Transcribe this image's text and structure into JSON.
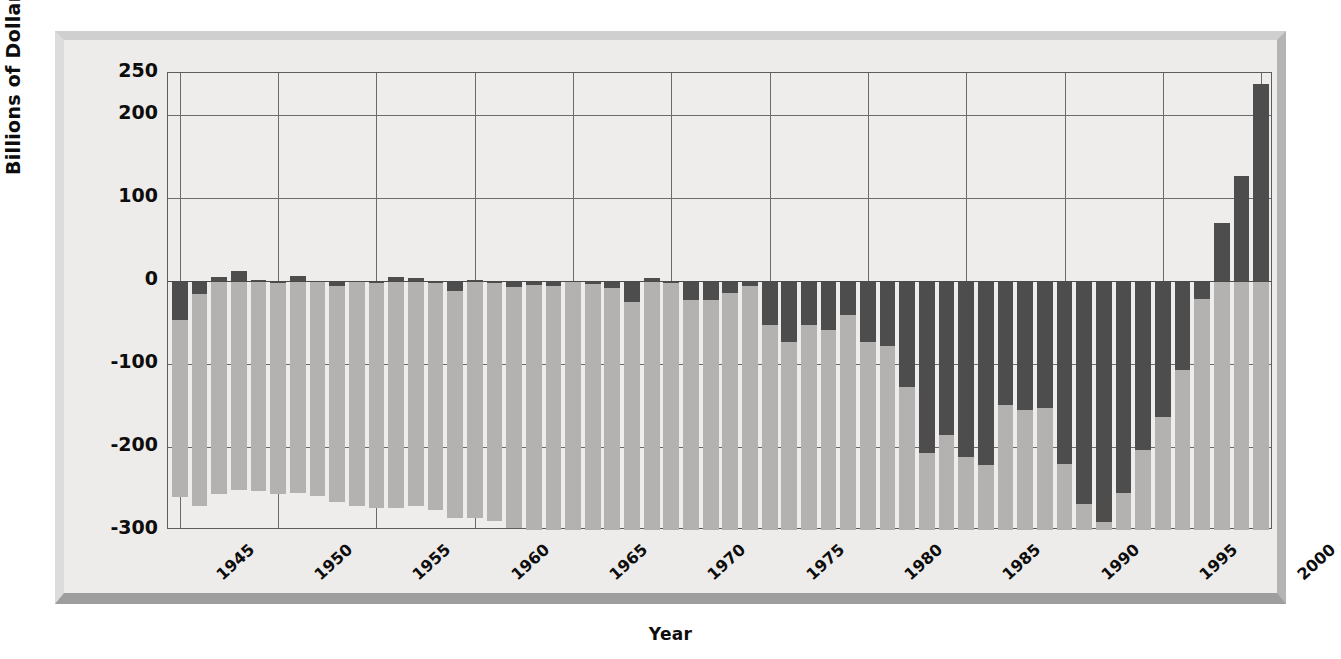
{
  "chart_data": {
    "type": "bar",
    "title": "",
    "xlabel": "Year",
    "ylabel": "Billions of Dollars",
    "ylim": [
      -300,
      250
    ],
    "xlim": [
      1944.4,
      2000.6
    ],
    "grid": true,
    "legend": "none",
    "y_ticks": [
      "250",
      "200",
      "100",
      "0",
      "-100",
      "-200",
      "-300"
    ],
    "y_tick_values": [
      250,
      200,
      100,
      0,
      -100,
      -200,
      -300
    ],
    "x_ticks": [
      "1945",
      "1950",
      "1955",
      "1960",
      "1965",
      "1970",
      "1975",
      "1980",
      "1985",
      "1990",
      "1995",
      "2000"
    ],
    "x_tick_values": [
      1945,
      1950,
      1955,
      1960,
      1965,
      1970,
      1975,
      1980,
      1985,
      1990,
      1995,
      2000
    ],
    "categories": [
      1945,
      1946,
      1947,
      1948,
      1949,
      1950,
      1951,
      1952,
      1953,
      1954,
      1955,
      1956,
      1957,
      1958,
      1959,
      1960,
      1961,
      1962,
      1963,
      1964,
      1965,
      1966,
      1967,
      1968,
      1969,
      1970,
      1971,
      1972,
      1973,
      1974,
      1975,
      1976,
      1977,
      1978,
      1979,
      1980,
      1981,
      1982,
      1983,
      1984,
      1985,
      1986,
      1987,
      1988,
      1989,
      1990,
      1991,
      1992,
      1993,
      1994,
      1995,
      1996,
      1997,
      1998,
      1999,
      2000
    ],
    "series": [
      {
        "name": "gross-national-debt",
        "color": "#b3b2b0",
        "note": "light bars, extend below the -300 axis floor (clipped)",
        "values": [
          -260,
          -271,
          -257,
          -252,
          -253,
          -257,
          -255,
          -259,
          -266,
          -271,
          -274,
          -273,
          -271,
          -276,
          -285,
          -286,
          -289,
          -298,
          -306,
          -312,
          -317,
          -320,
          -326,
          -348,
          -354,
          -371,
          -398,
          -427,
          -458,
          -475,
          -533,
          -620,
          -699,
          -772,
          -827,
          -908,
          -998,
          -1142,
          -1377,
          -1572,
          -1823,
          -2125,
          -2350,
          -2602,
          -2857,
          -3233,
          -3665,
          -4065,
          -4411,
          -4693,
          -4974,
          -5225,
          -5413,
          -5526,
          -5656,
          -5674
        ]
      },
      {
        "name": "annual-deficit-surplus",
        "color": "#4d4d4d",
        "note": "dark bars, federal budget surplus (+) or deficit (-)",
        "values": [
          -47.6,
          -15.9,
          4.0,
          11.8,
          0.6,
          -3.1,
          6.1,
          -1.5,
          -6.5,
          -1.2,
          -3.0,
          3.9,
          3.4,
          -2.8,
          -12.8,
          0.3,
          -3.3,
          -7.1,
          -4.8,
          -5.9,
          -1.4,
          -3.7,
          -8.6,
          -25.2,
          3.2,
          -2.8,
          -23.0,
          -23.4,
          -14.9,
          -6.1,
          -53.2,
          -73.7,
          -53.7,
          -59.2,
          -40.7,
          -73.8,
          -79.0,
          -128.0,
          -207.8,
          -185.4,
          -212.3,
          -221.2,
          -149.7,
          -155.2,
          -152.6,
          -221.0,
          -269.2,
          -290.3,
          -255.1,
          -203.2,
          -164.0,
          -107.4,
          -21.9,
          69.3,
          125.6,
          236.2
        ]
      }
    ]
  },
  "axis_titles": {
    "y": "Billions of Dollars",
    "x": "Year"
  }
}
